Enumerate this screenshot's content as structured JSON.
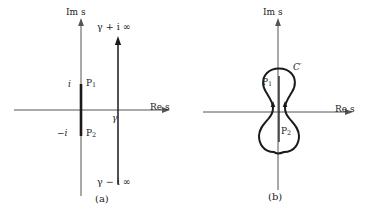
{
  "figure": {
    "panels": [
      {
        "id": "a",
        "caption": "(a)",
        "axis_imag_label": "Im s",
        "axis_real_label": "Re s",
        "origin_label": "O",
        "labels": {
          "i_positive": "i",
          "i_negative": "−i",
          "pole1": "P",
          "pole1_sub": "1",
          "pole2": "P",
          "pole2_sub": "2",
          "gamma": "γ",
          "top_endpoint": "γ + i ∞",
          "bottom_endpoint": "γ − i ∞"
        },
        "elements": {
          "branch_cut": "thick vertical segment on imaginary axis from -i to +i",
          "bromwich_line": "vertical line at Re s = gamma with upward arrow"
        }
      },
      {
        "id": "b",
        "caption": "(b)",
        "axis_imag_label": "Im s",
        "axis_real_label": "Re s",
        "labels": {
          "contour": "C",
          "contour_prime": "′",
          "pole1": "P",
          "pole1_sub": "1",
          "pole2": "P",
          "pole2_sub": "2"
        },
        "elements": {
          "contour_shape": "dumbbell closed contour C' enclosing branch cut",
          "direction_arrows": "two upward arrows on inner vertical segments"
        }
      }
    ],
    "colors": {
      "ink": "#1a1a1a",
      "axis": "#555555",
      "background": "#ffffff"
    }
  }
}
